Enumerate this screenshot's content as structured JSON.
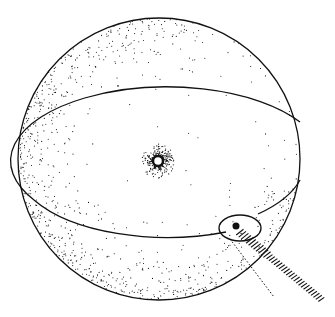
{
  "figure": {
    "sphere": {
      "cx": 159,
      "cy": 159,
      "r": 141
    },
    "equator": {
      "cx": 178,
      "cy": 163,
      "rx": 152,
      "ry": 72
    },
    "center_source": {
      "cx": 158,
      "cy": 161,
      "r": 5
    },
    "impact_marker": {
      "cx": 236,
      "cy": 231,
      "rx": 20,
      "ry": 13
    },
    "beam": {
      "x1": 236,
      "y1": 229,
      "x2": 322,
      "y2": 300
    },
    "colors": {
      "ink": "#111111",
      "background": "#ffffff"
    }
  }
}
